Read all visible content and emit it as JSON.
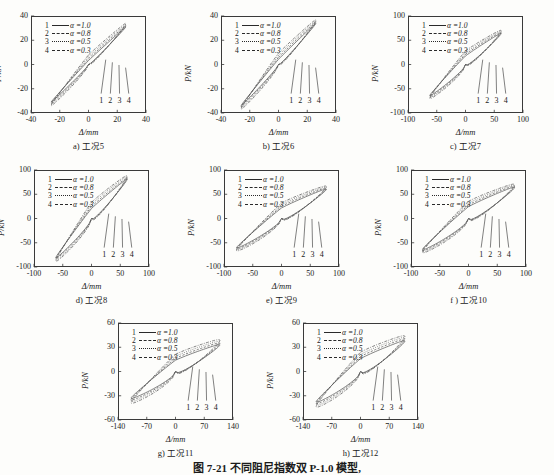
{
  "figure": {
    "caption": "图 7-21   不同阻尼指数双 P-1.0 模型,",
    "axis_x_label": "Δ/mm",
    "axis_y_label": "P/kN",
    "pointer_labels": [
      "1",
      "2",
      "3",
      "4"
    ],
    "legend": [
      {
        "num": "1",
        "style": "solid",
        "text": "α =1.0"
      },
      {
        "num": "2",
        "style": "dash",
        "text": "α =0.8"
      },
      {
        "num": "3",
        "style": "dot",
        "text": "α =0.5"
      },
      {
        "num": "4",
        "style": "dashdot",
        "text": "α =0.3"
      }
    ]
  },
  "chart_data": [
    {
      "id": "a",
      "type": "line",
      "title": "a) 工况5",
      "xlabel": "Δ/mm",
      "ylabel": "P/kN",
      "xlim": [
        -40,
        40
      ],
      "ylim": [
        -40,
        40
      ],
      "xticks": [
        "-40",
        "-20",
        "0",
        "20",
        "40"
      ],
      "yticks": [
        "-40",
        "-20",
        "0",
        "20",
        "40"
      ],
      "grid": false,
      "legend_position": "upper-left",
      "series": [
        {
          "name": "α =1.0",
          "peak_disp": 26,
          "peak_force": 33,
          "width": 0.1
        },
        {
          "name": "α =0.8",
          "peak_disp": 26,
          "peak_force": 34,
          "width": 0.14
        },
        {
          "name": "α =0.5",
          "peak_disp": 26,
          "peak_force": 35,
          "width": 0.18
        },
        {
          "name": "α =0.3",
          "peak_disp": 26,
          "peak_force": 36,
          "width": 0.22
        }
      ]
    },
    {
      "id": "b",
      "type": "line",
      "title": "b) 工况6",
      "xlabel": "Δ/mm",
      "ylabel": "P/kN",
      "xlim": [
        -40,
        40
      ],
      "ylim": [
        -40,
        40
      ],
      "xticks": [
        "-40",
        "-20",
        "0",
        "20",
        "40"
      ],
      "yticks": [
        "-40",
        "-20",
        "0",
        "20",
        "40"
      ],
      "grid": false,
      "legend_position": "upper-left",
      "series": [
        {
          "name": "α =1.0",
          "peak_disp": 26,
          "peak_force": 36,
          "width": 0.12
        },
        {
          "name": "α =0.8",
          "peak_disp": 26,
          "peak_force": 37,
          "width": 0.16
        },
        {
          "name": "α =0.5",
          "peak_disp": 26,
          "peak_force": 38,
          "width": 0.2
        },
        {
          "name": "α =0.3",
          "peak_disp": 26,
          "peak_force": 39,
          "width": 0.24
        }
      ]
    },
    {
      "id": "c",
      "type": "line",
      "title": "c) 工况7",
      "xlabel": "Δ/mm",
      "ylabel": "P/kN",
      "xlim": [
        -100,
        100
      ],
      "ylim": [
        -100,
        100
      ],
      "xticks": [
        "-100",
        "-50",
        "0",
        "50",
        "100"
      ],
      "yticks": [
        "-100",
        "-50",
        "0",
        "50",
        "100"
      ],
      "grid": false,
      "legend_position": "upper-left",
      "series": [
        {
          "name": "α =1.0",
          "peak_disp": 62,
          "peak_force": 68,
          "width": 0.26
        },
        {
          "name": "α =0.8",
          "peak_disp": 62,
          "peak_force": 70,
          "width": 0.3
        },
        {
          "name": "α =0.5",
          "peak_disp": 62,
          "peak_force": 72,
          "width": 0.34
        },
        {
          "name": "α =0.3",
          "peak_disp": 62,
          "peak_force": 74,
          "width": 0.38
        }
      ]
    },
    {
      "id": "d",
      "type": "line",
      "title": "d) 工况8",
      "xlabel": "Δ/mm",
      "ylabel": "P/kN",
      "xlim": [
        -100,
        100
      ],
      "ylim": [
        -100,
        100
      ],
      "xticks": [
        "-100",
        "-50",
        "0",
        "50",
        "100"
      ],
      "yticks": [
        "-100",
        "-50",
        "0",
        "50",
        "100"
      ],
      "grid": false,
      "legend_position": "upper-left",
      "series": [
        {
          "name": "α =1.0",
          "peak_disp": 62,
          "peak_force": 86,
          "width": 0.24
        },
        {
          "name": "α =0.8",
          "peak_disp": 62,
          "peak_force": 88,
          "width": 0.28
        },
        {
          "name": "α =0.5",
          "peak_disp": 62,
          "peak_force": 91,
          "width": 0.32
        },
        {
          "name": "α =0.3",
          "peak_disp": 62,
          "peak_force": 93,
          "width": 0.36
        }
      ]
    },
    {
      "id": "e",
      "type": "line",
      "title": "e) 工况9",
      "xlabel": "Δ/mm",
      "ylabel": "P/kN",
      "xlim": [
        -100,
        100
      ],
      "ylim": [
        -100,
        100
      ],
      "xticks": [
        "-100",
        "-50",
        "0",
        "50",
        "100"
      ],
      "yticks": [
        "-100",
        "-50",
        "0",
        "50",
        "100"
      ],
      "grid": false,
      "legend_position": "upper-left",
      "series": [
        {
          "name": "α =1.0",
          "peak_disp": 78,
          "peak_force": 64,
          "width": 0.34
        },
        {
          "name": "α =0.8",
          "peak_disp": 78,
          "peak_force": 66,
          "width": 0.38
        },
        {
          "name": "α =0.5",
          "peak_disp": 78,
          "peak_force": 68,
          "width": 0.42
        },
        {
          "name": "α =0.3",
          "peak_disp": 78,
          "peak_force": 70,
          "width": 0.46
        }
      ]
    },
    {
      "id": "f",
      "type": "line",
      "title": "f ) 工况10",
      "xlabel": "Δ/mm",
      "ylabel": "P/kN",
      "xlim": [
        -100,
        100
      ],
      "ylim": [
        -100,
        100
      ],
      "xticks": [
        "-100",
        "-50",
        "0",
        "50",
        "100"
      ],
      "yticks": [
        "-100",
        "-50",
        "0",
        "50",
        "100"
      ],
      "grid": false,
      "legend_position": "upper-left",
      "series": [
        {
          "name": "α =1.0",
          "peak_disp": 80,
          "peak_force": 68,
          "width": 0.36
        },
        {
          "name": "α =0.8",
          "peak_disp": 80,
          "peak_force": 70,
          "width": 0.4
        },
        {
          "name": "α =0.5",
          "peak_disp": 80,
          "peak_force": 72,
          "width": 0.44
        },
        {
          "name": "α =0.3",
          "peak_disp": 80,
          "peak_force": 74,
          "width": 0.48
        }
      ]
    },
    {
      "id": "g",
      "type": "line",
      "title": "g) 工况11",
      "xlabel": "Δ/mm",
      "ylabel": "P/kN",
      "xlim": [
        -140,
        140
      ],
      "ylim": [
        -60,
        60
      ],
      "xticks": [
        "-140",
        "-70",
        "0",
        "70",
        "140"
      ],
      "yticks": [
        "-60",
        "-30",
        "0",
        "30",
        "60"
      ],
      "grid": false,
      "legend_position": "upper-left",
      "series": [
        {
          "name": "α =1.0",
          "peak_disp": 108,
          "peak_force": 35,
          "width": 0.4
        },
        {
          "name": "α =0.8",
          "peak_disp": 108,
          "peak_force": 37,
          "width": 0.44
        },
        {
          "name": "α =0.5",
          "peak_disp": 108,
          "peak_force": 39,
          "width": 0.48
        },
        {
          "name": "α =0.3",
          "peak_disp": 108,
          "peak_force": 41,
          "width": 0.52
        }
      ]
    },
    {
      "id": "h",
      "type": "line",
      "title": "h) 工况12",
      "xlabel": "Δ/mm",
      "ylabel": "P/kN",
      "xlim": [
        -140,
        140
      ],
      "ylim": [
        -60,
        60
      ],
      "xticks": [
        "-140",
        "-70",
        "0",
        "70",
        "140"
      ],
      "yticks": [
        "-60",
        "-30",
        "0",
        "30",
        "60"
      ],
      "grid": false,
      "legend_position": "upper-left",
      "series": [
        {
          "name": "α =1.0",
          "peak_disp": 108,
          "peak_force": 40,
          "width": 0.4
        },
        {
          "name": "α =0.8",
          "peak_disp": 108,
          "peak_force": 42,
          "width": 0.44
        },
        {
          "name": "α =0.5",
          "peak_disp": 108,
          "peak_force": 44,
          "width": 0.48
        },
        {
          "name": "α =0.3",
          "peak_disp": 108,
          "peak_force": 46,
          "width": 0.52
        }
      ]
    }
  ]
}
